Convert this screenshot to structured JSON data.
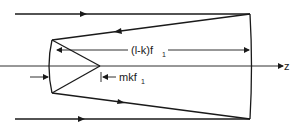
{
  "diagram": {
    "type": "optical ray diagram (two-mirror system)",
    "axis_label": "z",
    "dimension_long": {
      "main": "(l-k)f",
      "sub": "1"
    },
    "dimension_short": {
      "main": "mkf",
      "sub": "1"
    },
    "colors": {
      "stroke": "#1a1a1a",
      "background": "#ffffff"
    }
  }
}
